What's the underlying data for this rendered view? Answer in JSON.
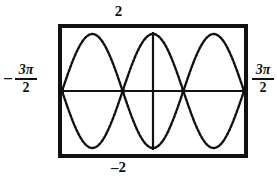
{
  "graph_window": {
    "title": "",
    "top_label": "2",
    "bottom_label": "–2",
    "left_label": {
      "sign": "–",
      "numerator": "3π",
      "denominator": "2"
    },
    "right_label": {
      "sign": "",
      "numerator": "3π",
      "denominator": "2"
    }
  },
  "chart_data": {
    "type": "line",
    "title": "",
    "xlabel": "",
    "ylabel": "",
    "xlim": [
      -4.71238898038469,
      4.71238898038469
    ],
    "ylim": [
      -2,
      2
    ],
    "xlim_labels": [
      "–3π/2",
      "3π/2"
    ],
    "ylim_labels": [
      "–2",
      "2"
    ],
    "grid": false,
    "legend": false,
    "axes_shown": true,
    "x_axis_y": 0,
    "y_axis_x": 0,
    "render_style": "dotted-pixel",
    "series": [
      {
        "name": "y = 2cos(x)",
        "expression": "2*cos(x)",
        "amplitude": 2,
        "period": 6.283185307179586,
        "points_x": [
          -4.7124,
          -4.3197,
          -3.927,
          -3.5343,
          -3.1416,
          -2.7489,
          -2.3562,
          -1.9635,
          -1.5708,
          -1.1781,
          -0.7854,
          -0.3927,
          0.0,
          0.3927,
          0.7854,
          1.1781,
          1.5708,
          1.9635,
          2.3562,
          2.7489,
          3.1416,
          3.5343,
          3.927,
          4.3197,
          4.7124
        ],
        "points_y": [
          0.0,
          -0.7654,
          -1.4142,
          -1.8478,
          -2.0,
          -1.8478,
          -1.4142,
          -0.7654,
          0.0,
          0.7654,
          1.4142,
          1.8478,
          2.0,
          1.8478,
          1.4142,
          0.7654,
          0.0,
          -0.7654,
          -1.4142,
          -1.8478,
          -2.0,
          -1.8478,
          -1.4142,
          -0.7654,
          0.0
        ]
      },
      {
        "name": "y = –2cos(x)",
        "expression": "-2*cos(x)",
        "amplitude": 2,
        "period": 6.283185307179586,
        "points_x": [
          -4.7124,
          -4.3197,
          -3.927,
          -3.5343,
          -3.1416,
          -2.7489,
          -2.3562,
          -1.9635,
          -1.5708,
          -1.1781,
          -0.7854,
          -0.3927,
          0.0,
          0.3927,
          0.7854,
          1.1781,
          1.5708,
          1.9635,
          2.3562,
          2.7489,
          3.1416,
          3.5343,
          3.927,
          4.3197,
          4.7124
        ],
        "points_y": [
          0.0,
          0.7654,
          1.4142,
          1.8478,
          2.0,
          1.8478,
          1.4142,
          0.7654,
          0.0,
          -0.7654,
          -1.4142,
          -1.8478,
          -2.0,
          -1.8478,
          -1.4142,
          -0.7654,
          0.0,
          0.7654,
          1.4142,
          1.8478,
          2.0,
          1.8478,
          1.4142,
          0.7654,
          0.0
        ]
      }
    ],
    "intersections_x": [
      -4.7124,
      -1.5708,
      1.5708,
      4.7124
    ],
    "colors": {
      "curve": "#111111",
      "axis": "#111111",
      "frame": "#111111",
      "background": "#ffffff"
    }
  }
}
